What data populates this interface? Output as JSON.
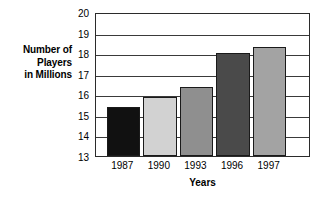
{
  "chart_data": {
    "type": "bar",
    "title": "",
    "categories": [
      "1987",
      "1990",
      "1993",
      "1996",
      "1997"
    ],
    "values": [
      15.4,
      15.85,
      16.35,
      18.0,
      18.3
    ],
    "xlabel": "Years",
    "ylabel": "Number of Players in Millions",
    "ylabel_lines": [
      "Number of",
      "Players",
      "in Millions"
    ],
    "ylim": [
      13,
      20
    ],
    "yticks": [
      13,
      14,
      15,
      16,
      17,
      18,
      19,
      20
    ],
    "ytick_labels": [
      "13",
      "14",
      "15",
      "16",
      "17",
      "18",
      "19",
      "20"
    ],
    "grid": true,
    "grid_axis": "y",
    "legend": false,
    "bar_colors": [
      "#111111",
      "#d2d2d2",
      "#8f8f8f",
      "#4a4a4a",
      "#a3a3a3"
    ],
    "bar_edge_color": "#1a1a1a",
    "frame_color": "#2b2b2b",
    "background": "#ffffff"
  }
}
